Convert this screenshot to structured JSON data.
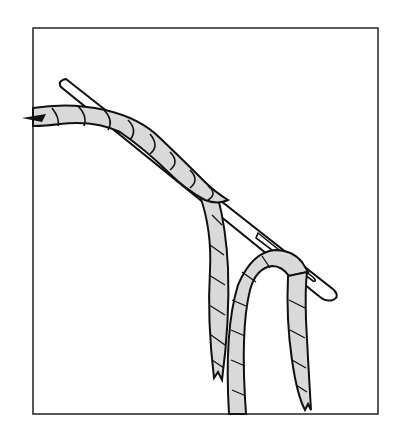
{
  "figure": {
    "description": "Line illustration of a twisted rope being threaded through the eye of a large needle, with two loose rope ends hanging down",
    "colors": {
      "background": "#ffffff",
      "outline": "#111111",
      "rope_fill": "#d9d9d9",
      "frame": "#222222"
    },
    "elements": [
      "frame",
      "needle",
      "rope-main",
      "rope-strand-left",
      "rope-loop",
      "rope-strand-right"
    ]
  }
}
